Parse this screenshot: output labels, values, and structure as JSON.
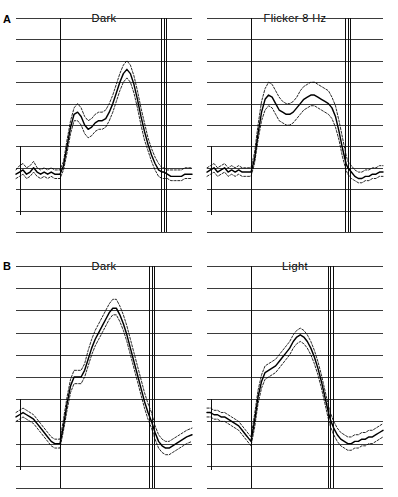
{
  "figure": {
    "rows": [
      {
        "letter": "A"
      },
      {
        "letter": "B"
      }
    ]
  },
  "panels": {
    "a_left": {
      "title": "Dark"
    },
    "a_right": {
      "title": "Flicker 8 Hz"
    },
    "b_left": {
      "title": "Dark"
    },
    "b_right": {
      "title": "Light"
    }
  },
  "chart_data": [
    {
      "type": "line",
      "panel": "A-left",
      "title": "Dark",
      "xlabel": "",
      "ylabel": "",
      "xlim": [
        0,
        100
      ],
      "ylim": [
        0,
        100
      ],
      "grid": true,
      "gridlines_horizontal": 10,
      "legend": "none",
      "annotations": [
        {
          "name": "stimulus-onset-marker",
          "type": "vertical-line",
          "x": 25,
          "lines": 1
        },
        {
          "name": "stimulus-offset-marker",
          "type": "vertical-line-triplet",
          "x": 84,
          "lines": 3
        },
        {
          "name": "amplitude-scale-bar",
          "type": "vertical-tick",
          "x": 2
        }
      ],
      "x": [
        0,
        2,
        4,
        6,
        8,
        10,
        12,
        14,
        16,
        18,
        20,
        22,
        24,
        25,
        27,
        29,
        31,
        33,
        35,
        37,
        39,
        41,
        43,
        45,
        47,
        49,
        51,
        53,
        55,
        57,
        59,
        61,
        63,
        65,
        67,
        69,
        71,
        73,
        75,
        77,
        79,
        81,
        83,
        84,
        86,
        88,
        90,
        92,
        94,
        96,
        98,
        100
      ],
      "series": [
        {
          "name": "mean",
          "style": "solid",
          "values": [
            27,
            28,
            29,
            27,
            28,
            30,
            28,
            27,
            28,
            27,
            28,
            27,
            27,
            27,
            31,
            40,
            49,
            55,
            56,
            54,
            50,
            48,
            49,
            51,
            52,
            52,
            53,
            56,
            60,
            65,
            70,
            74,
            76,
            74,
            69,
            62,
            54,
            47,
            41,
            36,
            32,
            29,
            28,
            28,
            27,
            26,
            26,
            26,
            26,
            27,
            27,
            27
          ]
        },
        {
          "name": "upper-confidence-band",
          "style": "dashed",
          "values": [
            29,
            31,
            32,
            30,
            31,
            33,
            30,
            29,
            30,
            29,
            30,
            29,
            29,
            29,
            33,
            43,
            52,
            58,
            60,
            58,
            54,
            52,
            53,
            55,
            56,
            56,
            57,
            60,
            64,
            69,
            74,
            78,
            80,
            78,
            73,
            66,
            58,
            51,
            44,
            39,
            35,
            32,
            30,
            30,
            29,
            29,
            29,
            29,
            29,
            30,
            30,
            30
          ]
        },
        {
          "name": "lower-confidence-band",
          "style": "dashed",
          "values": [
            25,
            26,
            27,
            25,
            26,
            28,
            26,
            25,
            26,
            25,
            26,
            25,
            25,
            25,
            29,
            37,
            46,
            52,
            52,
            50,
            46,
            44,
            45,
            47,
            48,
            48,
            49,
            52,
            56,
            61,
            66,
            70,
            72,
            70,
            65,
            58,
            50,
            43,
            38,
            33,
            29,
            26,
            25,
            25,
            25,
            24,
            24,
            24,
            24,
            25,
            25,
            25
          ]
        }
      ]
    },
    {
      "type": "line",
      "panel": "A-right",
      "title": "Flicker 8 Hz",
      "xlabel": "",
      "ylabel": "",
      "xlim": [
        0,
        100
      ],
      "ylim": [
        0,
        100
      ],
      "grid": true,
      "gridlines_horizontal": 10,
      "legend": "none",
      "annotations": [
        {
          "name": "stimulus-onset-marker",
          "type": "vertical-line",
          "x": 25,
          "lines": 1
        },
        {
          "name": "stimulus-offset-marker",
          "type": "vertical-line-triplet",
          "x": 80,
          "lines": 3
        },
        {
          "name": "amplitude-scale-bar",
          "type": "vertical-tick",
          "x": 2
        }
      ],
      "x": [
        0,
        2,
        4,
        6,
        8,
        10,
        12,
        14,
        16,
        18,
        20,
        22,
        24,
        25,
        27,
        29,
        31,
        33,
        35,
        37,
        39,
        41,
        43,
        45,
        47,
        49,
        51,
        53,
        55,
        57,
        59,
        61,
        63,
        65,
        67,
        69,
        71,
        73,
        75,
        77,
        79,
        80,
        82,
        84,
        86,
        88,
        90,
        92,
        94,
        96,
        98,
        100
      ],
      "series": [
        {
          "name": "mean",
          "style": "solid",
          "values": [
            28,
            29,
            30,
            28,
            29,
            30,
            28,
            29,
            28,
            29,
            28,
            28,
            28,
            28,
            34,
            46,
            56,
            62,
            64,
            63,
            60,
            57,
            56,
            55,
            55,
            56,
            58,
            60,
            62,
            63,
            64,
            64,
            63,
            62,
            61,
            60,
            58,
            54,
            47,
            39,
            32,
            30,
            28,
            26,
            25,
            25,
            26,
            26,
            27,
            27,
            28,
            28
          ]
        },
        {
          "name": "upper-confidence-band",
          "style": "dashed",
          "values": [
            30,
            31,
            32,
            30,
            31,
            32,
            30,
            31,
            30,
            31,
            30,
            30,
            30,
            30,
            37,
            50,
            61,
            67,
            70,
            69,
            66,
            63,
            61,
            60,
            60,
            61,
            63,
            66,
            68,
            69,
            70,
            70,
            69,
            68,
            67,
            66,
            63,
            59,
            52,
            44,
            36,
            33,
            31,
            29,
            28,
            28,
            29,
            29,
            30,
            30,
            31,
            31
          ]
        },
        {
          "name": "lower-confidence-band",
          "style": "dashed",
          "values": [
            26,
            27,
            28,
            26,
            27,
            28,
            26,
            27,
            26,
            27,
            26,
            26,
            26,
            26,
            32,
            43,
            52,
            57,
            59,
            58,
            55,
            52,
            51,
            50,
            50,
            51,
            53,
            55,
            57,
            58,
            59,
            59,
            58,
            57,
            56,
            55,
            53,
            49,
            43,
            35,
            29,
            27,
            25,
            24,
            23,
            23,
            24,
            24,
            25,
            25,
            26,
            26
          ]
        }
      ]
    },
    {
      "type": "line",
      "panel": "B-left",
      "title": "Dark",
      "xlabel": "",
      "ylabel": "",
      "xlim": [
        0,
        100
      ],
      "ylim": [
        0,
        100
      ],
      "grid": true,
      "gridlines_horizontal": 10,
      "legend": "none",
      "annotations": [
        {
          "name": "stimulus-onset-marker",
          "type": "vertical-line",
          "x": 25,
          "lines": 1
        },
        {
          "name": "stimulus-offset-marker",
          "type": "vertical-line-triplet",
          "x": 77,
          "lines": 3
        },
        {
          "name": "amplitude-scale-bar",
          "type": "vertical-tick",
          "x": 2
        }
      ],
      "x": [
        0,
        2,
        4,
        6,
        8,
        10,
        12,
        14,
        16,
        18,
        20,
        22,
        24,
        25,
        27,
        29,
        31,
        33,
        35,
        37,
        39,
        41,
        43,
        45,
        47,
        49,
        51,
        53,
        55,
        57,
        59,
        61,
        63,
        65,
        67,
        69,
        71,
        73,
        75,
        77,
        79,
        81,
        83,
        85,
        87,
        89,
        91,
        93,
        95,
        97,
        100
      ],
      "series": [
        {
          "name": "mean",
          "style": "solid",
          "values": [
            32,
            33,
            34,
            33,
            32,
            31,
            29,
            27,
            25,
            23,
            21,
            20,
            20,
            20,
            28,
            38,
            46,
            50,
            50,
            50,
            53,
            58,
            63,
            67,
            70,
            73,
            76,
            79,
            81,
            81,
            78,
            74,
            69,
            63,
            57,
            51,
            45,
            39,
            34,
            30,
            25,
            21,
            19,
            18,
            18,
            19,
            20,
            21,
            22,
            23,
            24
          ]
        },
        {
          "name": "upper-confidence-band",
          "style": "dashed",
          "values": [
            34,
            35,
            36,
            35,
            34,
            33,
            31,
            29,
            27,
            25,
            23,
            22,
            22,
            22,
            31,
            41,
            49,
            53,
            53,
            53,
            56,
            62,
            67,
            71,
            74,
            77,
            80,
            83,
            85,
            85,
            82,
            78,
            73,
            67,
            61,
            55,
            49,
            43,
            38,
            34,
            28,
            24,
            22,
            21,
            21,
            22,
            23,
            24,
            25,
            26,
            27
          ]
        },
        {
          "name": "lower-confidence-band",
          "style": "dashed",
          "values": [
            30,
            31,
            32,
            31,
            30,
            29,
            27,
            25,
            23,
            21,
            19,
            18,
            18,
            18,
            26,
            35,
            43,
            47,
            47,
            47,
            50,
            55,
            60,
            64,
            67,
            70,
            73,
            76,
            78,
            78,
            75,
            71,
            66,
            60,
            54,
            48,
            42,
            36,
            31,
            27,
            22,
            18,
            16,
            15,
            15,
            16,
            17,
            18,
            19,
            20,
            21
          ]
        }
      ]
    },
    {
      "type": "line",
      "panel": "B-right",
      "title": "Light",
      "xlabel": "",
      "ylabel": "",
      "xlim": [
        0,
        100
      ],
      "ylim": [
        0,
        100
      ],
      "grid": true,
      "gridlines_horizontal": 10,
      "legend": "none",
      "annotations": [
        {
          "name": "stimulus-onset-marker",
          "type": "vertical-line",
          "x": 25,
          "lines": 1
        },
        {
          "name": "stimulus-offset-marker",
          "type": "vertical-line-triplet",
          "x": 70,
          "lines": 3
        },
        {
          "name": "amplitude-scale-bar",
          "type": "vertical-tick",
          "x": 2
        }
      ],
      "x": [
        0,
        2,
        4,
        6,
        8,
        10,
        12,
        14,
        16,
        18,
        20,
        22,
        24,
        25,
        27,
        29,
        31,
        33,
        35,
        37,
        39,
        41,
        43,
        45,
        47,
        49,
        51,
        53,
        55,
        57,
        59,
        61,
        63,
        65,
        67,
        69,
        70,
        72,
        74,
        76,
        78,
        80,
        82,
        84,
        86,
        88,
        90,
        92,
        94,
        96,
        98,
        100
      ],
      "series": [
        {
          "name": "mean",
          "style": "solid",
          "values": [
            34,
            34,
            33,
            33,
            32,
            32,
            31,
            30,
            29,
            28,
            26,
            24,
            22,
            21,
            30,
            41,
            48,
            52,
            53,
            54,
            55,
            57,
            59,
            61,
            63,
            66,
            68,
            69,
            68,
            66,
            63,
            59,
            54,
            48,
            41,
            34,
            31,
            27,
            24,
            22,
            21,
            20,
            20,
            21,
            21,
            22,
            22,
            23,
            23,
            24,
            25,
            26
          ]
        },
        {
          "name": "upper-confidence-band",
          "style": "dashed",
          "values": [
            36,
            36,
            35,
            35,
            34,
            34,
            33,
            32,
            31,
            30,
            28,
            26,
            24,
            23,
            33,
            44,
            51,
            55,
            56,
            57,
            58,
            60,
            62,
            64,
            66,
            69,
            71,
            72,
            71,
            69,
            66,
            62,
            57,
            51,
            44,
            37,
            34,
            30,
            27,
            25,
            24,
            23,
            23,
            24,
            24,
            25,
            25,
            26,
            26,
            27,
            28,
            29
          ]
        },
        {
          "name": "lower-confidence-band",
          "style": "dashed",
          "values": [
            32,
            32,
            31,
            31,
            30,
            30,
            29,
            28,
            27,
            26,
            24,
            22,
            20,
            19,
            27,
            38,
            45,
            49,
            50,
            51,
            52,
            54,
            56,
            58,
            60,
            63,
            65,
            66,
            65,
            63,
            60,
            56,
            51,
            45,
            38,
            31,
            28,
            24,
            21,
            19,
            18,
            17,
            17,
            18,
            18,
            19,
            19,
            20,
            20,
            21,
            22,
            23
          ]
        }
      ]
    }
  ]
}
